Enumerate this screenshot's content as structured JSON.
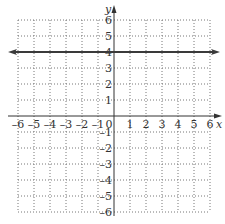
{
  "chart_data": {
    "type": "line",
    "title": "",
    "xlabel": "x",
    "ylabel": "y",
    "xlim": [
      -6,
      6
    ],
    "ylim": [
      -6,
      6
    ],
    "grid": true,
    "grid_style": "dotted",
    "x_ticks": [
      -6,
      -5,
      -4,
      -3,
      -2,
      -1,
      0,
      1,
      2,
      3,
      4,
      5,
      6
    ],
    "y_ticks": [
      -6,
      -5,
      -4,
      -3,
      -2,
      -1,
      1,
      2,
      3,
      4,
      5,
      6
    ],
    "x_tick_labels": [
      "-6",
      "-5",
      "-4",
      "-3",
      "-2",
      "-1",
      "0",
      "1",
      "2",
      "3",
      "4",
      "5",
      "6"
    ],
    "y_tick_labels": [
      "-6",
      "-5",
      "-4",
      "-3",
      "-2",
      "-1",
      "1",
      "2",
      "3",
      "4",
      "5",
      "6"
    ],
    "series": [
      {
        "name": "y = 4",
        "equation": "y = 4",
        "x": [
          -6.5,
          6.5
        ],
        "y": [
          4,
          4
        ],
        "arrows": "both",
        "color": "#3a3a3a"
      }
    ],
    "legend": null
  },
  "colors": {
    "axis": "#333333",
    "grid": "#777777",
    "line": "#3a3a3a",
    "text": "#333333"
  }
}
